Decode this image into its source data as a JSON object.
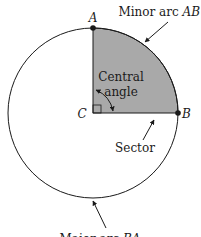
{
  "diagram": {
    "type": "circle-sector",
    "points": {
      "A": "A",
      "B": "B",
      "C": "C"
    },
    "labels": {
      "minor_arc_prefix": "Minor arc ",
      "minor_arc_name": "AB",
      "central_angle_line1": "Central",
      "central_angle_line2": "angle",
      "sector": "Sector",
      "major_arc_prefix": "Major arc ",
      "major_arc_name": "BA"
    },
    "colors": {
      "sector_fill": "#a9a9a9",
      "stroke": "#1a1a1a",
      "background": "#ffffff"
    },
    "central_angle_degrees": 90
  }
}
